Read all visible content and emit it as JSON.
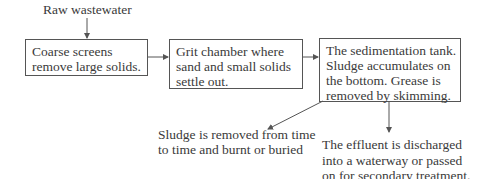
{
  "diagram": {
    "input_label": "Raw wastewater",
    "steps": [
      {
        "text": "Coarse screens\nremove large solids."
      },
      {
        "text": "Grit chamber where\nsand and small solids\nsettle out."
      },
      {
        "text": "The sedimentation tank.\nSludge accumulates on\nthe bottom. Grease is\nremoved by skimming."
      }
    ],
    "outputs": {
      "sludge": "Sludge is removed from time\nto time and burnt or buried",
      "effluent": "The effluent is discharged\ninto a waterway or passed\non for secondary treatment."
    }
  }
}
